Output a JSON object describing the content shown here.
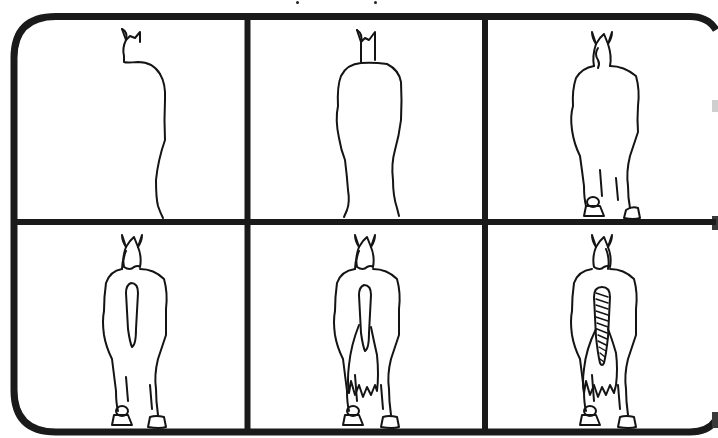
{
  "colors": {
    "background": "#ffffff",
    "ink": "#141414",
    "frame": "#1a1a1a"
  },
  "layout": {
    "rows": 2,
    "columns": 3,
    "frame_border_px": 7,
    "corner_radius_px": 42
  },
  "panels": [
    {
      "index": 1,
      "row": 1,
      "col": 1,
      "step": "Draw the outline of the head, ears and one side of the body",
      "elements": [
        "ears",
        "head-side",
        "body-right-side"
      ]
    },
    {
      "index": 2,
      "row": 1,
      "col": 2,
      "step": "Complete the body outline with both sides",
      "elements": [
        "ears",
        "neck",
        "body-outline",
        "legs-upper"
      ]
    },
    {
      "index": 3,
      "row": 1,
      "col": 3,
      "step": "Add the head detail, legs and hooves",
      "elements": [
        "ears",
        "head",
        "mane",
        "body-outline",
        "legs",
        "hooves"
      ]
    },
    {
      "index": 4,
      "row": 2,
      "col": 1,
      "step": "Sketch the tail dock shape",
      "elements": [
        "ears",
        "head",
        "mane",
        "body-outline",
        "legs",
        "hooves",
        "tail-dock"
      ]
    },
    {
      "index": 5,
      "row": 2,
      "col": 2,
      "step": "Add the flowing tail hair with jagged ends",
      "elements": [
        "ears",
        "head",
        "mane",
        "body-outline",
        "legs",
        "hooves",
        "tail-dock",
        "tail-hair"
      ]
    },
    {
      "index": 6,
      "row": 2,
      "col": 3,
      "step": "Draw the braid pattern down the tail",
      "elements": [
        "ears",
        "head",
        "mane",
        "body-outline",
        "legs",
        "hooves",
        "braided-tail",
        "tail-hair"
      ]
    }
  ]
}
